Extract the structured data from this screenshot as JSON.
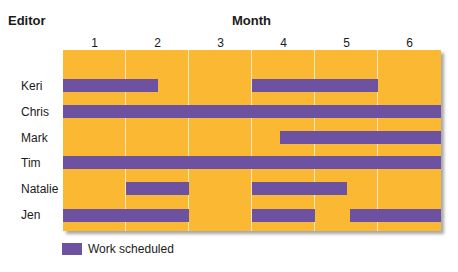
{
  "chart_data": {
    "type": "gantt",
    "title": "",
    "row_header": "Editor",
    "column_header": "Month",
    "categories": [
      "1",
      "2",
      "3",
      "4",
      "5",
      "6"
    ],
    "rows": [
      {
        "name": "Keri",
        "segments": [
          [
            1,
            2.5
          ],
          [
            4,
            6
          ]
        ]
      },
      {
        "name": "Chris",
        "segments": [
          [
            1,
            7
          ]
        ]
      },
      {
        "name": "Mark",
        "segments": [
          [
            4.45,
            7
          ]
        ]
      },
      {
        "name": "Tim",
        "segments": [
          [
            1,
            7
          ]
        ]
      },
      {
        "name": "Natalie",
        "segments": [
          [
            2,
            3
          ],
          [
            4,
            5.5
          ]
        ]
      },
      {
        "name": "Jen",
        "segments": [
          [
            1,
            3
          ],
          [
            4,
            5
          ],
          [
            5.55,
            7
          ]
        ]
      }
    ],
    "legend": [
      {
        "label": "Work scheduled",
        "color": "#6c52a0"
      }
    ],
    "colors": {
      "background": "#fbb933",
      "bar": "#6c52a0"
    },
    "grid": true
  },
  "labels": {
    "editor": "Editor",
    "month": "Month",
    "months": [
      "1",
      "2",
      "3",
      "4",
      "5",
      "6"
    ],
    "editors": [
      "Keri",
      "Chris",
      "Mark",
      "Tim",
      "Natalie",
      "Jen"
    ],
    "legend": "Work scheduled"
  }
}
